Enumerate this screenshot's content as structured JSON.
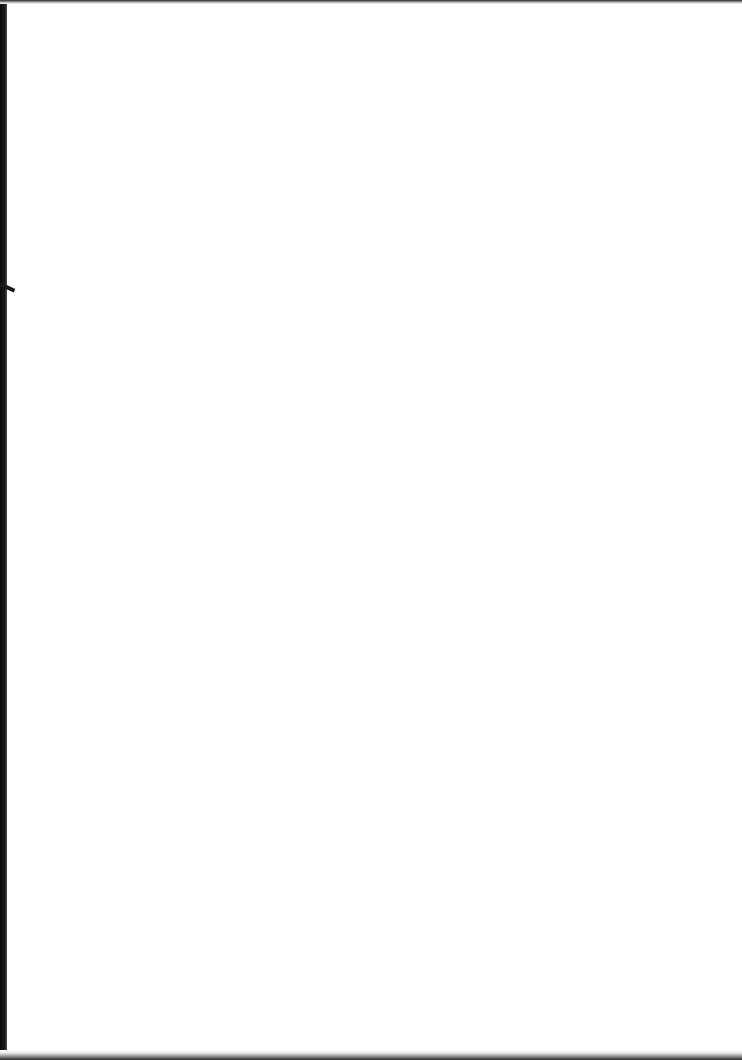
{
  "document": {
    "type": "scanned blank page",
    "content": "",
    "colors": {
      "page": "#ffffff",
      "scan_border": "#0a0a0a"
    }
  }
}
